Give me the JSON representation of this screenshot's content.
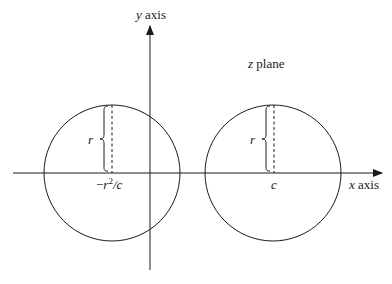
{
  "diagram": {
    "title": "z plane",
    "axes": {
      "x_label_var": "x",
      "x_label_word": "axis",
      "y_label_var": "y",
      "y_label_word": "axis"
    },
    "left_circle": {
      "center_label_neg": "−",
      "center_label_r": "r",
      "center_label_sup": "2",
      "center_label_rest": "/c",
      "radius_label": "r"
    },
    "right_circle": {
      "center_label": "c",
      "radius_label": "r"
    },
    "colors": {
      "stroke": "#1a1a1a",
      "background": "#ffffff"
    }
  }
}
